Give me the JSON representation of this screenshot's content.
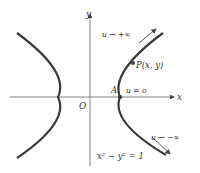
{
  "diagram": {
    "type": "hyperbola",
    "equation": "x² − y² = 1",
    "axes": {
      "x_label": "x",
      "y_label": "y",
      "origin_label": "O"
    },
    "points": [
      {
        "label": "P(x, y)"
      },
      {
        "label": "A"
      }
    ],
    "annotations": {
      "top": "u → +∞",
      "vertex": "u = o",
      "bottom": "u → −∞"
    },
    "colors": {
      "curve": "#3a3a3a",
      "axis": "#555555",
      "text": "#333333"
    }
  }
}
